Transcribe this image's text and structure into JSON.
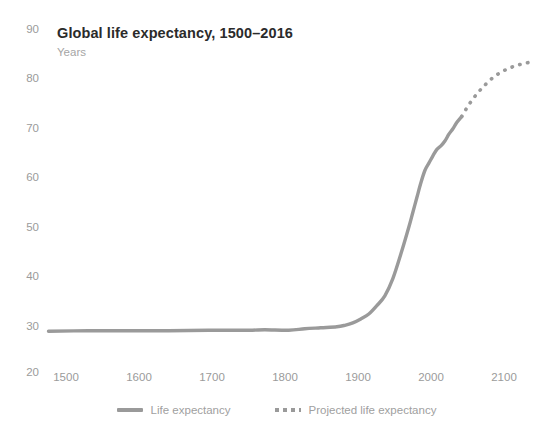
{
  "header": {
    "title": "Global life expectancy, 1500–2016",
    "subtitle": "Years"
  },
  "colors": {
    "line": "#9a9a9a",
    "axis": "#c8c8c8",
    "tick_text": "#9b9b9b",
    "title_text": "#2b2b2b",
    "subtitle_text": "#a5a5a5",
    "background": "#ffffff"
  },
  "legend": {
    "position": "bottom-center",
    "items": [
      {
        "label": "Life expectancy",
        "style": "solid",
        "marker": "solid-line-swatch"
      },
      {
        "label": "Projected life expectancy",
        "style": "dotted",
        "marker": "dotted-line-swatch"
      }
    ]
  },
  "axes": {
    "y_ticks": [
      "90",
      "80",
      "70",
      "60",
      "50",
      "40",
      "30",
      "20"
    ],
    "x_ticks": [
      "1500",
      "1600",
      "1700",
      "1800",
      "1900",
      "2000",
      "2100"
    ]
  },
  "chart_data": {
    "type": "line",
    "title": "Global life expectancy, 1500–2016",
    "subtitle": "Years",
    "xlabel": "",
    "ylabel": "Years",
    "xlim": [
      1500,
      2120
    ],
    "ylim": [
      20,
      90
    ],
    "xticks": [
      1500,
      1600,
      1700,
      1800,
      1900,
      2000,
      2100
    ],
    "yticks": [
      20,
      30,
      40,
      50,
      60,
      70,
      80,
      90
    ],
    "grid": false,
    "legend_position": "bottom-center",
    "series": [
      {
        "name": "Life expectancy",
        "style": "solid",
        "color": "#9a9a9a",
        "x": [
          1500,
          1550,
          1600,
          1650,
          1700,
          1750,
          1770,
          1800,
          1820,
          1840,
          1860,
          1870,
          1880,
          1890,
          1900,
          1910,
          1920,
          1930,
          1940,
          1950,
          1955,
          1960,
          1965,
          1970,
          1975,
          1980,
          1985,
          1990,
          1995,
          2000,
          2005,
          2010,
          2016
        ],
        "y": [
          28.3,
          28.4,
          28.4,
          28.4,
          28.5,
          28.5,
          28.6,
          28.5,
          28.8,
          29.0,
          29.2,
          29.5,
          30.0,
          30.8,
          31.8,
          33.5,
          35.5,
          39.0,
          44.0,
          49.5,
          52.5,
          55.5,
          58.5,
          61.0,
          62.5,
          64.0,
          65.3,
          66.0,
          67.0,
          68.4,
          69.5,
          70.8,
          72.0
        ]
      },
      {
        "name": "Projected life expectancy",
        "style": "dotted",
        "color": "#9a9a9a",
        "x": [
          2016,
          2025,
          2035,
          2045,
          2055,
          2065,
          2075,
          2085,
          2095,
          2100
        ],
        "y": [
          72.0,
          74.4,
          76.6,
          78.4,
          79.9,
          81.0,
          81.8,
          82.4,
          82.8,
          83.0
        ]
      }
    ]
  }
}
